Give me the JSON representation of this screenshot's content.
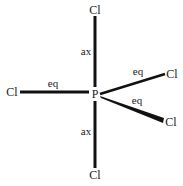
{
  "molecule": {
    "center_atom": "P",
    "ligands": {
      "axial_top": "Cl",
      "axial_bottom": "Cl",
      "equatorial_left": "Cl",
      "equatorial_upper_right": "Cl",
      "equatorial_lower_right": "Cl"
    },
    "labels": {
      "axial_top": "ax",
      "axial_bottom": "ax",
      "equatorial_left": "eq",
      "equatorial_upper_right": "eq",
      "equatorial_lower_right": "eq"
    }
  },
  "colors": {
    "bond": "#111111",
    "text": "#1a1a1a",
    "background": "#ffffff"
  }
}
